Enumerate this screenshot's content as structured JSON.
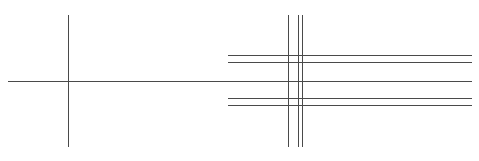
{
  "canvas": {
    "width": 479,
    "height": 161,
    "background": "#ffffff",
    "stroke_color": "#4a4a4a",
    "stroke_width": 1
  },
  "left_cross": {
    "vertical": {
      "x": 68.5,
      "y1": 15,
      "y2": 147
    },
    "horizontal": {
      "y": 81.5,
      "x1": 8,
      "x2": 472
    }
  },
  "right_grid": {
    "verticals": [
      {
        "x": 288.5,
        "y1": 15,
        "y2": 147
      },
      {
        "x": 298.5,
        "y1": 15,
        "y2": 147
      },
      {
        "x": 302.5,
        "y1": 15,
        "y2": 147
      }
    ],
    "horizontals": [
      {
        "y": 55.5,
        "x1": 228,
        "x2": 472
      },
      {
        "y": 62.5,
        "x1": 228,
        "x2": 472
      },
      {
        "y": 98.5,
        "x1": 228,
        "x2": 472
      },
      {
        "y": 105.5,
        "x1": 228,
        "x2": 472
      }
    ]
  }
}
